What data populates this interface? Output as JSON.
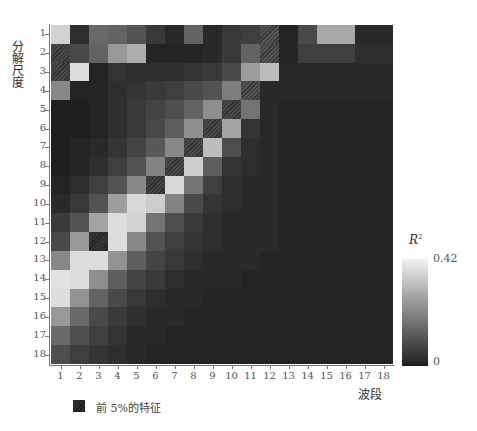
{
  "chart_data": {
    "type": "heatmap",
    "title": "",
    "xlabel": "波段",
    "ylabel": "分解尺度",
    "x_ticks": [
      "1",
      "2",
      "3",
      "4",
      "5",
      "6",
      "7",
      "8",
      "9",
      "10",
      "11",
      "12",
      "13",
      "14",
      "15",
      "16",
      "17",
      "18"
    ],
    "y_ticks": [
      "1",
      "2",
      "3",
      "4",
      "5",
      "6",
      "7",
      "8",
      "9",
      "10",
      "11",
      "12",
      "13",
      "14",
      "15",
      "16",
      "17",
      "18"
    ],
    "colorbar": {
      "label": "R²",
      "min": 0,
      "max": 0.42,
      "min_label": "0",
      "max_label": "0.42",
      "colormap": "gray"
    },
    "legend": [
      {
        "label": "前 5%的特征",
        "style": "hatched"
      }
    ],
    "values": [
      [
        0.36,
        0.05,
        0.16,
        0.15,
        0.12,
        0.07,
        0.04,
        0.15,
        0.04,
        0.07,
        0.08,
        0.12,
        0.03,
        0.1,
        0.28,
        0.28,
        0.04,
        0.04
      ],
      [
        0.1,
        0.1,
        0.15,
        0.25,
        0.29,
        0.03,
        0.03,
        0.03,
        0.04,
        0.07,
        0.15,
        0.12,
        0.03,
        0.08,
        0.08,
        0.08,
        0.05,
        0.05
      ],
      [
        0.1,
        0.38,
        0.03,
        0.06,
        0.05,
        0.05,
        0.05,
        0.06,
        0.07,
        0.1,
        0.26,
        0.32,
        0.04,
        0.04,
        0.04,
        0.04,
        0.04,
        0.04
      ],
      [
        0.22,
        0.03,
        0.03,
        0.05,
        0.06,
        0.07,
        0.08,
        0.1,
        0.12,
        0.2,
        0.12,
        0.04,
        0.04,
        0.04,
        0.04,
        0.04,
        0.04,
        0.04
      ],
      [
        0.02,
        0.02,
        0.03,
        0.05,
        0.07,
        0.09,
        0.11,
        0.15,
        0.23,
        0.1,
        0.18,
        0.04,
        0.03,
        0.03,
        0.03,
        0.03,
        0.03,
        0.03
      ],
      [
        0.02,
        0.02,
        0.03,
        0.05,
        0.07,
        0.1,
        0.14,
        0.23,
        0.1,
        0.27,
        0.06,
        0.04,
        0.03,
        0.03,
        0.03,
        0.03,
        0.03,
        0.03
      ],
      [
        0.02,
        0.03,
        0.04,
        0.06,
        0.09,
        0.13,
        0.22,
        0.1,
        0.32,
        0.11,
        0.05,
        0.04,
        0.03,
        0.03,
        0.03,
        0.03,
        0.03,
        0.03
      ],
      [
        0.02,
        0.03,
        0.05,
        0.08,
        0.12,
        0.21,
        0.1,
        0.35,
        0.14,
        0.06,
        0.05,
        0.04,
        0.03,
        0.03,
        0.03,
        0.03,
        0.03,
        0.03
      ],
      [
        0.03,
        0.05,
        0.08,
        0.12,
        0.22,
        0.09,
        0.37,
        0.18,
        0.08,
        0.05,
        0.04,
        0.04,
        0.03,
        0.03,
        0.03,
        0.03,
        0.03,
        0.03
      ],
      [
        0.04,
        0.07,
        0.12,
        0.26,
        0.37,
        0.35,
        0.21,
        0.1,
        0.06,
        0.05,
        0.04,
        0.04,
        0.03,
        0.03,
        0.03,
        0.03,
        0.03,
        0.03
      ],
      [
        0.07,
        0.12,
        0.27,
        0.38,
        0.36,
        0.18,
        0.11,
        0.07,
        0.05,
        0.04,
        0.04,
        0.04,
        0.03,
        0.03,
        0.03,
        0.03,
        0.03,
        0.03
      ],
      [
        0.1,
        0.25,
        0.06,
        0.38,
        0.22,
        0.12,
        0.08,
        0.06,
        0.05,
        0.04,
        0.04,
        0.04,
        0.03,
        0.03,
        0.03,
        0.03,
        0.03,
        0.03
      ],
      [
        0.22,
        0.38,
        0.38,
        0.24,
        0.14,
        0.09,
        0.07,
        0.05,
        0.04,
        0.04,
        0.04,
        0.03,
        0.03,
        0.03,
        0.03,
        0.03,
        0.03,
        0.03
      ],
      [
        0.39,
        0.38,
        0.23,
        0.14,
        0.09,
        0.07,
        0.05,
        0.04,
        0.04,
        0.04,
        0.03,
        0.03,
        0.03,
        0.03,
        0.03,
        0.03,
        0.03,
        0.03
      ],
      [
        0.38,
        0.24,
        0.15,
        0.1,
        0.07,
        0.05,
        0.04,
        0.04,
        0.03,
        0.03,
        0.03,
        0.03,
        0.03,
        0.03,
        0.03,
        0.03,
        0.03,
        0.03
      ],
      [
        0.25,
        0.16,
        0.1,
        0.07,
        0.05,
        0.04,
        0.04,
        0.03,
        0.03,
        0.03,
        0.03,
        0.03,
        0.03,
        0.03,
        0.03,
        0.03,
        0.03,
        0.03
      ],
      [
        0.16,
        0.11,
        0.08,
        0.06,
        0.04,
        0.04,
        0.03,
        0.03,
        0.03,
        0.03,
        0.03,
        0.03,
        0.03,
        0.03,
        0.03,
        0.03,
        0.03,
        0.03
      ],
      [
        0.11,
        0.08,
        0.06,
        0.05,
        0.04,
        0.03,
        0.03,
        0.03,
        0.03,
        0.03,
        0.03,
        0.03,
        0.03,
        0.03,
        0.03,
        0.03,
        0.03,
        0.03
      ]
    ],
    "top5_cells": [
      [
        2,
        1
      ],
      [
        3,
        1
      ],
      [
        1,
        12
      ],
      [
        2,
        12
      ],
      [
        4,
        11
      ],
      [
        5,
        10
      ],
      [
        6,
        9
      ],
      [
        7,
        8
      ],
      [
        8,
        7
      ],
      [
        9,
        6
      ],
      [
        12,
        3
      ]
    ]
  }
}
